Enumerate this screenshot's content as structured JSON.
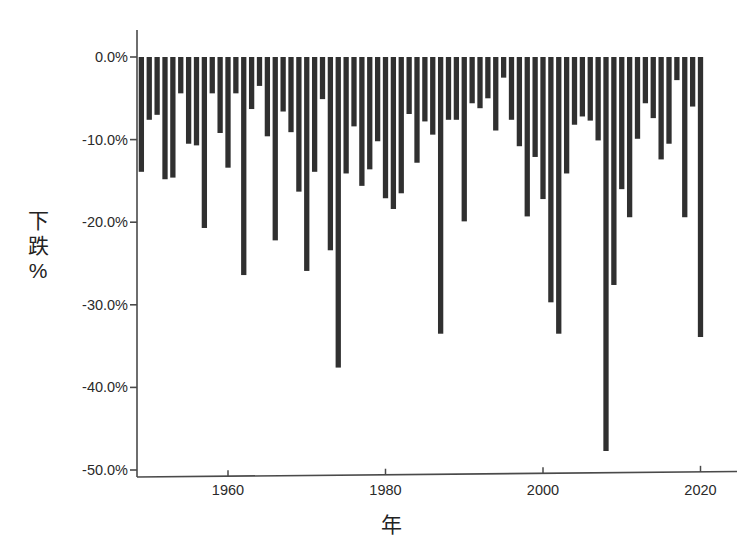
{
  "chart_data": {
    "type": "bar",
    "title": "",
    "subtitle": "",
    "xlabel": "年",
    "ylabel": "下跌%",
    "ylabel_chars": [
      "下",
      "跌",
      "%"
    ],
    "grid": false,
    "legend": null,
    "bar_color": "#303030",
    "axis_color": "#4a4a4a",
    "background": "#ffffff",
    "xlim": [
      1947.5,
      2023.5
    ],
    "ylim": [
      -53.5,
      1.5
    ],
    "x_ticks": [
      1960,
      1980,
      2000,
      2020
    ],
    "x_tick_labels": [
      "1960",
      "1980",
      "2000",
      "2020"
    ],
    "y_ticks": [
      0,
      -10,
      -20,
      -30,
      -40,
      -50
    ],
    "y_tick_labels": [
      "0.0%",
      "-10.0%",
      "-20.0%",
      "-30.0%",
      "-40.0%",
      "-50.0%"
    ],
    "value_unit": "percent",
    "note": "Annual maximum drawdown per calendar year",
    "categories": [
      1949,
      1950,
      1951,
      1952,
      1953,
      1954,
      1955,
      1956,
      1957,
      1958,
      1959,
      1960,
      1961,
      1962,
      1963,
      1964,
      1965,
      1966,
      1967,
      1968,
      1969,
      1970,
      1971,
      1972,
      1973,
      1974,
      1975,
      1976,
      1977,
      1978,
      1979,
      1980,
      1981,
      1982,
      1983,
      1984,
      1985,
      1986,
      1987,
      1988,
      1989,
      1990,
      1991,
      1992,
      1993,
      1994,
      1995,
      1996,
      1997,
      1998,
      1999,
      2000,
      2001,
      2002,
      2003,
      2004,
      2005,
      2006,
      2007,
      2008,
      2009,
      2010,
      2011,
      2012,
      2013,
      2014,
      2015,
      2016,
      2017,
      2018,
      2019,
      2020
    ],
    "values": [
      -13.9,
      -7.6,
      -7.0,
      -14.8,
      -14.6,
      -4.4,
      -10.5,
      -10.7,
      -20.7,
      -4.4,
      -9.2,
      -13.4,
      -4.4,
      -26.4,
      -6.3,
      -3.5,
      -9.6,
      -22.2,
      -6.6,
      -9.1,
      -16.3,
      -25.9,
      -13.9,
      -5.1,
      -23.4,
      -37.6,
      -14.1,
      -8.4,
      -15.6,
      -13.6,
      -10.2,
      -17.1,
      -18.4,
      -16.5,
      -6.9,
      -12.8,
      -7.8,
      -9.4,
      -33.5,
      -7.6,
      -7.6,
      -19.9,
      -5.6,
      -6.2,
      -5.0,
      -8.9,
      -2.5,
      -7.6,
      -10.8,
      -19.3,
      -12.1,
      -17.2,
      -29.7,
      -33.5,
      -14.1,
      -8.2,
      -7.2,
      -7.7,
      -10.1,
      -47.7,
      -27.6,
      -16.0,
      -19.4,
      -9.9,
      -5.6,
      -7.4,
      -12.4,
      -10.5,
      -2.8,
      -19.4,
      -6.0,
      -33.9
    ]
  }
}
